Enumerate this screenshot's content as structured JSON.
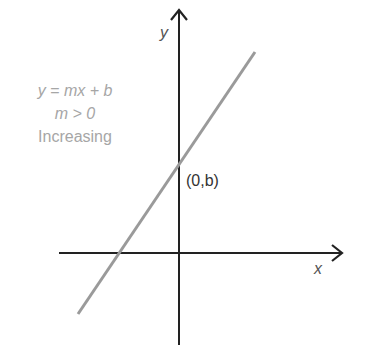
{
  "diagram": {
    "title_lines": {
      "equation": "y = mx + b",
      "condition": "m > 0",
      "description": "Increasing"
    },
    "axes": {
      "x_label": "x",
      "y_label": "y"
    },
    "point_label": "(0,b)",
    "colors": {
      "axis": "#222222",
      "line": "#9a9a9a",
      "text_light": "#a6a6a6"
    }
  }
}
